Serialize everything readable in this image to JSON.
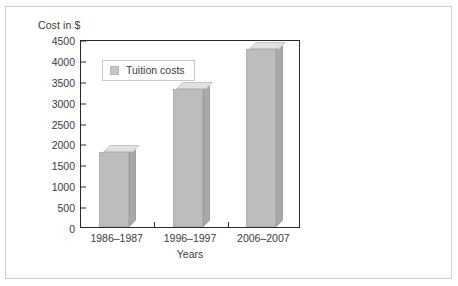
{
  "chart_data": {
    "type": "bar",
    "title": "",
    "ylabel": "Cost in $",
    "xlabel": "Years",
    "categories": [
      "1986–1987",
      "1996–1997",
      "2006–2007"
    ],
    "series": [
      {
        "name": "Tuition costs",
        "values": [
          1800,
          3300,
          4250
        ]
      }
    ],
    "ylim": [
      0,
      4500
    ],
    "ytick_labels": [
      "0",
      "500",
      "1000",
      "1500",
      "2000",
      "2500",
      "3000",
      "3500",
      "4000",
      "4500"
    ],
    "ytick_values": [
      0,
      500,
      1000,
      1500,
      2000,
      2500,
      3000,
      3500,
      4000,
      4500
    ],
    "grid": false,
    "legend": {
      "position": "upper-left-inside",
      "entries": [
        {
          "label": "Tuition costs",
          "color": "#c6c6c6"
        }
      ]
    },
    "colors": {
      "bar_front": "#bdbdbd",
      "bar_top": "#e2e2e2",
      "bar_side": "#a8a8a8",
      "axis": "#2b2b2b",
      "text": "#3a3a3a",
      "outer_border": "#cfcfcf",
      "background": "#ffffff"
    }
  }
}
